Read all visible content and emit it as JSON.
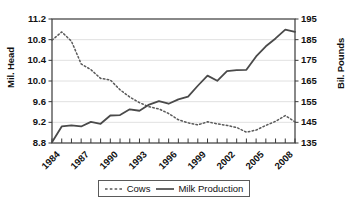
{
  "chart_data": {
    "type": "line",
    "title": "",
    "xlabel": "",
    "ylabel": "Mil. Head",
    "ylabel_right": "Bil. Pounds",
    "grid": true,
    "legend_position": "bottom",
    "x": [
      1984,
      1985,
      1986,
      1987,
      1988,
      1989,
      1990,
      1991,
      1992,
      1993,
      1994,
      1995,
      1996,
      1997,
      1998,
      1999,
      2000,
      2001,
      2002,
      2003,
      2004,
      2005,
      2006,
      2007,
      2008,
      2009
    ],
    "xlim": [
      1984,
      2009
    ],
    "xticks": [
      1984,
      1987,
      1990,
      1993,
      1996,
      1999,
      2002,
      2005,
      2008
    ],
    "xtick_labels": [
      "1984",
      "1987",
      "1990",
      "1993",
      "1996",
      "1999",
      "2002",
      "2005",
      "2008"
    ],
    "ylim": [
      8.8,
      11.2
    ],
    "yticks": [
      8.8,
      9.2,
      9.6,
      10.0,
      10.4,
      10.8,
      11.2
    ],
    "ytick_labels": [
      "8.8",
      "9.2",
      "9.6",
      "10.0",
      "10.4",
      "10.8",
      "11.2"
    ],
    "ylim_right": [
      135,
      195
    ],
    "yticks_right": [
      135,
      145,
      155,
      165,
      175,
      185,
      195
    ],
    "ytick_labels_right": [
      "135",
      "145",
      "155",
      "165",
      "175",
      "185",
      "195"
    ],
    "series": [
      {
        "name": "Cows",
        "axis": "left",
        "style": "dotted",
        "color": "#5a5a5a",
        "unit": "Mil. Head",
        "values": [
          10.79,
          10.95,
          10.77,
          10.33,
          10.22,
          10.05,
          10.02,
          9.83,
          9.69,
          9.58,
          9.5,
          9.46,
          9.37,
          9.25,
          9.19,
          9.15,
          9.21,
          9.17,
          9.14,
          9.1,
          9.01,
          9.05,
          9.14,
          9.22,
          9.33,
          9.21
        ]
      },
      {
        "name": "Milk Production",
        "axis": "right",
        "style": "solid",
        "color": "#4a4a4a",
        "unit": "Bil. Pounds",
        "values": [
          135.4,
          143.0,
          143.5,
          143.0,
          145.2,
          144.3,
          148.3,
          148.5,
          151.3,
          150.6,
          153.6,
          155.3,
          154.0,
          156.1,
          157.4,
          162.7,
          167.6,
          165.1,
          169.8,
          170.3,
          170.4,
          176.9,
          181.8,
          185.6,
          189.9,
          188.8
        ]
      }
    ]
  },
  "legend": {
    "items": [
      {
        "label": "Cows",
        "style": "dotted"
      },
      {
        "label": "Milk Production",
        "style": "solid"
      }
    ]
  },
  "colors": {
    "series_cows": "#5a5a5a",
    "series_milk": "#4a4a4a",
    "axis": "#3a3a3a",
    "grid": "#d8d8d8",
    "background": "#ffffff"
  }
}
